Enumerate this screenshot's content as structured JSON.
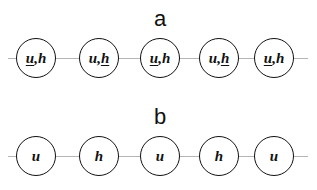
{
  "panel_a": {
    "label": "a",
    "nodes": [
      {
        "first": "u",
        "sep": ",",
        "second": "h",
        "underlined": "u"
      },
      {
        "first": "u",
        "sep": ",",
        "second": "h",
        "underlined": "h"
      },
      {
        "first": "u",
        "sep": ",",
        "second": "h",
        "underlined": "u"
      },
      {
        "first": "u",
        "sep": ",",
        "second": "h",
        "underlined": "h"
      },
      {
        "first": "u",
        "sep": ",",
        "second": "h",
        "underlined": "u"
      }
    ]
  },
  "panel_b": {
    "label": "b",
    "nodes": [
      {
        "text": "u"
      },
      {
        "text": "h"
      },
      {
        "text": "u"
      },
      {
        "text": "h"
      },
      {
        "text": "u"
      }
    ]
  },
  "colors": {
    "node_border": "#111111",
    "link_line": "#b5b5b5",
    "background": "#ffffff"
  }
}
